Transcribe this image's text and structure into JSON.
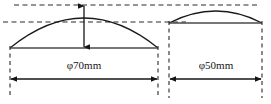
{
  "figure": {
    "background_color": "#ffffff",
    "line_color": "#1a1a1a",
    "dashed_color": "#2b2b2b",
    "baseline_color": "#4a4a4a",
    "width": 271,
    "height": 104
  },
  "shapes": {
    "left_dome": {
      "label": "φ70mm",
      "phi_symbol": "φ",
      "diameter_value": "70",
      "unit": "mm",
      "span_left_x": 10,
      "span_right_x": 158,
      "baseline_y": 48,
      "apex_x": 84,
      "apex_y": 5,
      "height_px": 43
    },
    "right_dome": {
      "label": "φ50mm",
      "phi_symbol": "φ",
      "diameter_value": "50",
      "unit": "mm",
      "span_left_x": 169,
      "span_right_x": 262,
      "baseline_y": 23,
      "apex_x": 216,
      "apex_y": 8,
      "height_px": 15
    }
  },
  "reference_lines": {
    "upper_dashed_y": 5,
    "lower_dashed_y": 22,
    "upper_dashed_label": "apex-reference-line",
    "lower_dashed_label": "secondary-reference-line"
  },
  "dimensions": {
    "height_arrow": {
      "name": "left-dome-height-arrow",
      "x": 84,
      "top_y": 6,
      "bottom_y": 47,
      "double_headed": true
    },
    "left_width_arrow": {
      "name": "left-dome-diameter-arrow",
      "y": 79,
      "x_start": 11,
      "x_end": 157,
      "double_headed": true
    },
    "right_width_arrow": {
      "name": "right-dome-diameter-arrow",
      "y": 79,
      "x_start": 170,
      "x_end": 261,
      "double_headed": true
    }
  },
  "extension_lines": {
    "left_dome_left": {
      "x": 10,
      "y_top": 45,
      "y_bottom": 98
    },
    "left_dome_right": {
      "x": 158,
      "y_top": 45,
      "y_bottom": 98
    },
    "right_dome_left": {
      "x": 169,
      "y_top": 20,
      "y_bottom": 98
    },
    "right_dome_right": {
      "x": 262,
      "y_top": 20,
      "y_bottom": 98
    }
  },
  "labels": {
    "left_label_x": 84,
    "left_label_y": 66,
    "right_label_x": 216,
    "right_label_y": 66
  }
}
